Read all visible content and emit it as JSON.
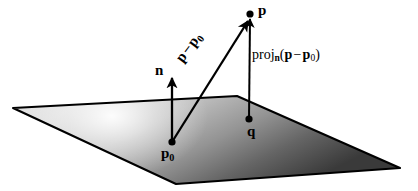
{
  "figure": {
    "background_color": "#ffffff",
    "ink_color": "#000000",
    "plane": {
      "name": "plane",
      "fill_light": "#f2f2f2",
      "fill_mid": "#b8b8b8",
      "fill_dark": "#3a3a3a",
      "edge_color": "#000000",
      "corners": [
        {
          "x": 13,
          "y": 108
        },
        {
          "x": 237,
          "y": 96
        },
        {
          "x": 400,
          "y": 168
        },
        {
          "x": 176,
          "y": 184
        }
      ],
      "highlight": {
        "cx": 112,
        "cy": 116,
        "r": 96
      }
    },
    "points": [
      {
        "id": "p",
        "x": 250,
        "y": 14,
        "label": "p"
      },
      {
        "id": "q",
        "x": 249,
        "y": 119,
        "label": "q"
      },
      {
        "id": "p0",
        "x": 172,
        "y": 142,
        "label": "p",
        "subscript": "0"
      }
    ],
    "vectors": [
      {
        "id": "normal",
        "label": "n",
        "from": {
          "x": 172,
          "y": 142
        },
        "to": {
          "x": 172,
          "y": 75
        }
      },
      {
        "id": "p-minus-p0",
        "label_parts": {
          "lead": "p",
          "operator": "−",
          "tail": "p",
          "tail_sub": "0"
        },
        "from": {
          "x": 172,
          "y": 142
        },
        "to": {
          "x": 249,
          "y": 18
        }
      },
      {
        "id": "projection",
        "from": {
          "x": 249,
          "y": 119
        },
        "to": {
          "x": 250,
          "y": 16
        }
      }
    ],
    "labels": {
      "point_p": "p",
      "point_q": "q",
      "point_p0_base": "p",
      "point_p0_sub": "0",
      "normal_n": "n",
      "vector_lead": "p",
      "vector_operator": "−",
      "vector_tail": "p",
      "vector_tail_sub": "0",
      "proj_name": "proj",
      "proj_sub": "n",
      "proj_open": "(",
      "proj_arg_lead": "p",
      "proj_operator": "−",
      "proj_arg_tail": "p",
      "proj_arg_tail_sub": "0",
      "proj_close": ")"
    }
  }
}
